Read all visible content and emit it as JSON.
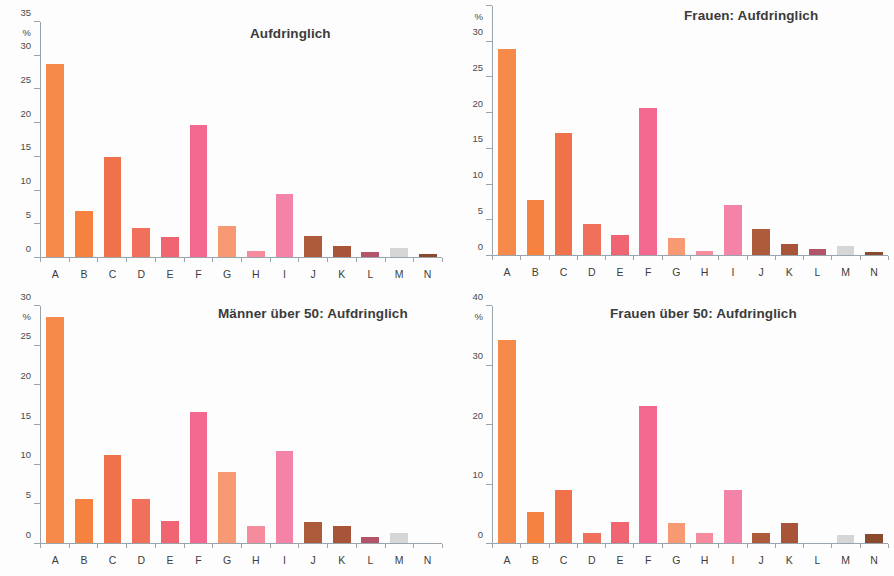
{
  "figure": {
    "background": "#fdfdfd",
    "axis_color": "#9aa4ad",
    "title_color": "#3b3b3b",
    "label_color": "#3d3d3d",
    "percent_symbol": "%"
  },
  "category_colors": {
    "A": "#F58A4A",
    "B": "#F5823F",
    "C": "#F0724A",
    "D": "#F0705C",
    "E": "#EF6572",
    "F": "#F2688F",
    "G": "#F79A74",
    "H": "#F58C9E",
    "I": "#F583A8",
    "J": "#AE5B3C",
    "K": "#A85439",
    "L": "#B35569",
    "M": "#D6D6D6",
    "N": "#8A4A2E"
  },
  "chart_data": [
    {
      "id": "aufdringlich-gesamt",
      "type": "bar",
      "title": "Aufdringlich",
      "xlabel": "",
      "ylabel": "%",
      "ylim": [
        0,
        35
      ],
      "yticks": [
        0,
        5,
        10,
        15,
        20,
        25,
        30,
        35
      ],
      "grid": false,
      "legend": "none",
      "categories": [
        "A",
        "B",
        "C",
        "D",
        "E",
        "F",
        "G",
        "H",
        "I",
        "J",
        "K",
        "L",
        "M",
        "N"
      ],
      "values": [
        28.7,
        6.8,
        14.9,
        4.3,
        3.0,
        19.6,
        4.6,
        0.9,
        9.4,
        3.1,
        1.7,
        0.7,
        1.3,
        0.4
      ]
    },
    {
      "id": "aufdringlich-frauen",
      "type": "bar",
      "title": "Frauen: Aufdringlich",
      "xlabel": "",
      "ylabel": "%",
      "ylim": [
        0,
        35
      ],
      "yticks": [
        0,
        5,
        10,
        15,
        20,
        25,
        30,
        35
      ],
      "grid": false,
      "legend": "none",
      "categories": [
        "A",
        "B",
        "C",
        "D",
        "E",
        "F",
        "G",
        "H",
        "I",
        "J",
        "K",
        "L",
        "M",
        "N"
      ],
      "values": [
        28.9,
        7.8,
        17.1,
        4.3,
        2.8,
        20.6,
        2.4,
        0.5,
        7.1,
        3.7,
        1.6,
        0.8,
        1.2,
        0.4
      ]
    },
    {
      "id": "aufdringlich-maenner-ueber-50",
      "type": "bar",
      "title": "Männer über 50: Aufdringlich",
      "xlabel": "",
      "ylabel": "%",
      "ylim": [
        0,
        30
      ],
      "yticks": [
        0,
        5,
        10,
        15,
        20,
        25,
        30
      ],
      "grid": false,
      "legend": "none",
      "categories": [
        "A",
        "B",
        "C",
        "D",
        "E",
        "F",
        "G",
        "H",
        "I",
        "J",
        "K",
        "L",
        "M",
        "N"
      ],
      "values": [
        28.6,
        5.6,
        11.1,
        5.6,
        2.8,
        16.6,
        9.0,
        2.1,
        11.7,
        2.7,
        2.1,
        0.7,
        1.3,
        0.0
      ]
    },
    {
      "id": "aufdringlich-frauen-ueber-50",
      "type": "bar",
      "title": "Frauen über 50: Aufdringlich",
      "xlabel": "",
      "ylabel": "%",
      "ylim": [
        0,
        40
      ],
      "yticks": [
        0,
        10,
        20,
        30,
        40
      ],
      "grid": false,
      "legend": "none",
      "categories": [
        "A",
        "B",
        "C",
        "D",
        "E",
        "F",
        "G",
        "H",
        "I",
        "J",
        "K",
        "L",
        "M",
        "N"
      ],
      "values": [
        34.3,
        5.2,
        9.0,
        1.7,
        3.5,
        23.2,
        3.4,
        1.7,
        8.9,
        1.7,
        3.4,
        0.0,
        1.4,
        1.6
      ]
    }
  ]
}
